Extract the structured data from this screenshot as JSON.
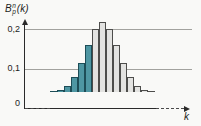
{
  "figure": {
    "y_axis_label": {
      "base": "B",
      "sup": "n",
      "sub": "p",
      "suffix": "(k)"
    },
    "x_axis_label": "k",
    "y_ticks": {
      "t02": "0,2",
      "t01": "0,1",
      "t0": "0"
    },
    "colors": {
      "highlight_bar_fill": "#4e96a2",
      "highlight_bar_border": "#1d4d57",
      "normal_bar_fill": "#e3e3e1",
      "normal_bar_border": "#4d4d4b",
      "gridline": "#a2a29e",
      "axis": "#2a2a2a",
      "background": "#f9f9f7"
    }
  },
  "chart_data": {
    "type": "bar",
    "xlabel": "k",
    "ylabel": "B_p^n(k)",
    "ylim": [
      0,
      0.22
    ],
    "y_tick_values": [
      0,
      0.1,
      0.2
    ],
    "y_tick_labels": [
      "0",
      "0,1",
      "0,2"
    ],
    "gridlines": [
      0.1,
      0.2
    ],
    "legend": "none",
    "x": [
      3,
      4,
      5,
      6,
      7,
      8,
      9,
      10,
      11,
      12,
      13,
      14,
      15,
      16,
      17
    ],
    "values": [
      0.0011,
      0.0046,
      0.0148,
      0.037,
      0.0739,
      0.1201,
      0.1602,
      0.1762,
      0.1602,
      0.1201,
      0.0739,
      0.037,
      0.0148,
      0.0046,
      0.0011
    ],
    "highlighted_x": [
      3,
      4,
      5,
      6,
      7,
      8
    ],
    "highlight_meaning": "teal bars on rising left flank, gray bars from mode rightward"
  }
}
